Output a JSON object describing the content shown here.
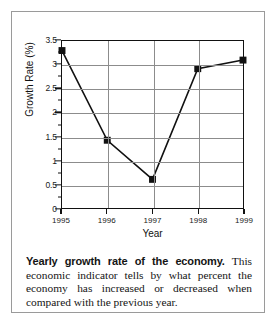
{
  "chart_data": {
    "type": "line",
    "title": "",
    "xlabel": "Year",
    "ylabel": "Growth Rate (%)",
    "categories": [
      "1995",
      "1996",
      "1997",
      "1998",
      "1999"
    ],
    "x": [
      1995,
      1996,
      1997,
      1998,
      1999
    ],
    "values": [
      3.3,
      1.42,
      0.6,
      2.92,
      3.1
    ],
    "series": [
      {
        "name": "Growth Rate",
        "values": [
          3.3,
          1.42,
          0.6,
          2.92,
          3.1
        ]
      }
    ],
    "ylim": [
      0,
      3.5
    ],
    "xlim": [
      1995,
      1999
    ],
    "yticks": [
      "0",
      "0.5",
      "1",
      "1.5",
      "2",
      "2.5",
      "3",
      "3.5"
    ],
    "ytick_values": [
      0,
      0.5,
      1,
      1.5,
      2,
      2.5,
      3,
      3.5
    ],
    "xticks": [
      "1995",
      "1996",
      "1997",
      "1998",
      "1999"
    ],
    "grid": "horizontal-and-vertical",
    "legend": "none",
    "marker": "filled-square",
    "line_color": "#111111",
    "marker_color": "#111111",
    "grid_color": "#8c8c8c",
    "frame_color": "#111111",
    "background": "#ffffff"
  },
  "caption": {
    "lead": "Yearly growth rate of the economy.",
    "body": " This economic indicator tells by what percent the economy has increased or decreased when compared with the previous year."
  }
}
